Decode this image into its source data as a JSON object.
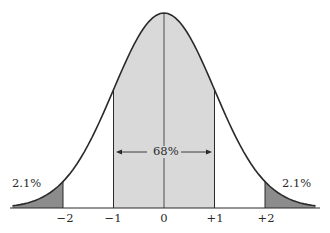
{
  "chart_data": {
    "type": "area",
    "title": "",
    "xlabel": "",
    "ylabel": "",
    "x_ticks": [
      "-2",
      "-1",
      "0",
      "+1",
      "+2"
    ],
    "x_tick_values": [
      -2,
      -1,
      0,
      1,
      2
    ],
    "xlim": [
      -3.0,
      3.0
    ],
    "regions": [
      {
        "name": "left-tail",
        "from": -3.0,
        "to": -2,
        "percent": "2.1%",
        "fill": "#8c8c8c"
      },
      {
        "name": "center",
        "from": -1,
        "to": 1,
        "percent": "68%",
        "fill": "#d9d9d9"
      },
      {
        "name": "right-tail",
        "from": 2,
        "to": 3.0,
        "percent": "2.1%",
        "fill": "#8c8c8c"
      }
    ],
    "annotations": [
      {
        "text": "68%",
        "type": "double-arrow",
        "from": -1,
        "to": 1
      },
      {
        "text": "2.1%",
        "position": "left-tail"
      },
      {
        "text": "2.1%",
        "position": "right-tail"
      }
    ],
    "grid": false
  },
  "labels": {
    "center_percent": "68%",
    "left_tail_percent": "2.1%",
    "right_tail_percent": "2.1%",
    "ticks": [
      "−2",
      "−1",
      "0",
      "+1",
      "+2"
    ]
  },
  "colors": {
    "curve": "#2a2a2a",
    "center_fill": "#d9d9d9",
    "tail_fill": "#8c8c8c",
    "axis": "#2a2a2a"
  }
}
